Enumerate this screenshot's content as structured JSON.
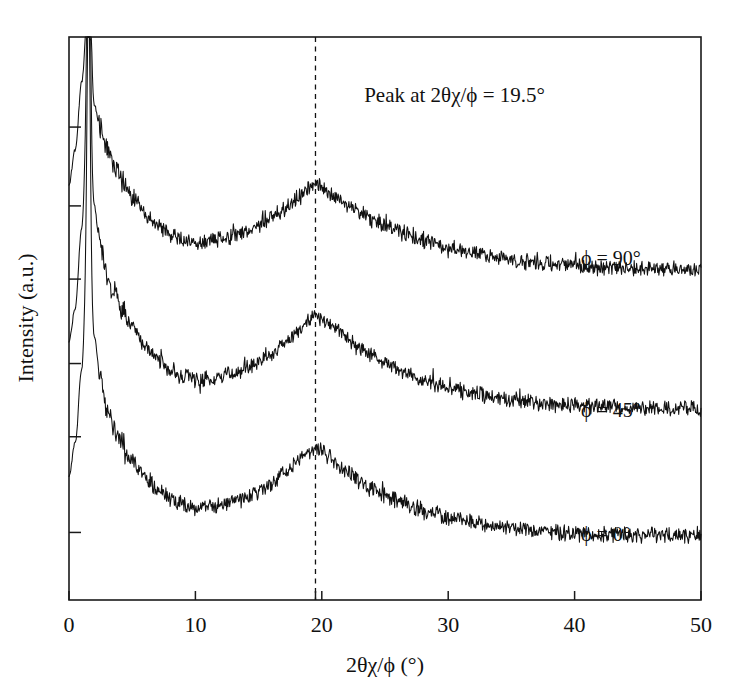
{
  "chart_data": {
    "type": "line",
    "title": "",
    "subtitle": "",
    "xlabel": "2θχ/ϕ (°)",
    "ylabel": "Intensity (a.u.)",
    "xlim": [
      0,
      50
    ],
    "ylim": [
      0,
      1
    ],
    "grid": false,
    "legend_position": "inline-right",
    "xticks": [
      0,
      10,
      20,
      30,
      40,
      50
    ],
    "xticklabels": [
      "0",
      "10",
      "20",
      "30",
      "40",
      "50"
    ],
    "yticks": [
      0.12,
      0.29,
      0.42,
      0.57,
      0.7,
      0.84
    ],
    "yticklabels": [
      "",
      "",
      "",
      "",
      "",
      ""
    ],
    "annotations": [
      {
        "name": "peak-annotation",
        "text": "Peak at 2θχ/ϕ = 19.5°",
        "x": 30.5,
        "y": 0.885
      }
    ],
    "reference_lines": [
      {
        "name": "peak-guideline",
        "orientation": "vertical",
        "x": 19.5,
        "style": "dashed",
        "label": "19.5"
      }
    ],
    "series": [
      {
        "name": "phi-90",
        "label": "ϕ = 90°",
        "label_x": 40.5,
        "label_y": 0.595,
        "offset": 0.565,
        "peak_center": 19.5,
        "peak_height": 0.175,
        "peak_width": 7.2,
        "baseline_decay": 0.055,
        "low_angle_spike_x": 1.55,
        "noise": 0.011,
        "x": [
          0.0,
          0.5,
          1.0,
          1.4,
          1.55,
          1.7,
          2.0,
          2.4,
          3.0,
          3.6,
          4.2,
          5.0,
          6.0,
          7.0,
          8.0,
          9.0,
          10.0,
          11.0,
          12.0,
          13.0,
          14.0,
          15.0,
          16.0,
          17.0,
          18.0,
          19.0,
          19.5,
          20.0,
          21.0,
          22.0,
          23.0,
          24.0,
          25.0,
          26.0,
          28.0,
          30.0,
          32.0,
          34.0,
          36.0,
          38.0,
          40.0,
          42.0,
          44.0,
          46.0,
          48.0,
          50.0
        ],
        "y": [
          0.74,
          0.8,
          0.92,
          1.0,
          1.0,
          0.96,
          0.88,
          0.845,
          0.805,
          0.775,
          0.745,
          0.715,
          0.685,
          0.665,
          0.65,
          0.64,
          0.636,
          0.636,
          0.639,
          0.644,
          0.652,
          0.664,
          0.678,
          0.694,
          0.712,
          0.731,
          0.74,
          0.735,
          0.718,
          0.702,
          0.688,
          0.676,
          0.665,
          0.655,
          0.639,
          0.626,
          0.616,
          0.608,
          0.602,
          0.597,
          0.594,
          0.592,
          0.59,
          0.589,
          0.588,
          0.587
        ]
      },
      {
        "name": "phi-45",
        "label": "ϕ = 45°",
        "label_x": 40.5,
        "label_y": 0.325,
        "offset": 0.285,
        "peak_center": 19.5,
        "peak_height": 0.185,
        "peak_width": 7.0,
        "baseline_decay": 0.055,
        "low_angle_spike_x": 1.55,
        "noise": 0.011,
        "x": [
          0.0,
          0.5,
          1.0,
          1.4,
          1.55,
          1.7,
          2.0,
          2.4,
          3.0,
          3.6,
          4.2,
          5.0,
          6.0,
          7.0,
          8.0,
          9.0,
          10.0,
          11.0,
          12.0,
          13.0,
          14.0,
          15.0,
          16.0,
          17.0,
          18.0,
          19.0,
          19.5,
          20.0,
          21.0,
          22.0,
          23.0,
          24.0,
          25.0,
          26.0,
          28.0,
          30.0,
          32.0,
          34.0,
          36.0,
          38.0,
          40.0,
          42.0,
          44.0,
          46.0,
          48.0,
          50.0
        ],
        "y": [
          0.46,
          0.52,
          0.66,
          0.82,
          0.845,
          0.8,
          0.7,
          0.64,
          0.575,
          0.54,
          0.512,
          0.485,
          0.452,
          0.428,
          0.41,
          0.398,
          0.392,
          0.392,
          0.396,
          0.402,
          0.411,
          0.423,
          0.438,
          0.456,
          0.476,
          0.497,
          0.507,
          0.5,
          0.482,
          0.464,
          0.448,
          0.434,
          0.421,
          0.41,
          0.392,
          0.378,
          0.368,
          0.36,
          0.354,
          0.349,
          0.346,
          0.344,
          0.342,
          0.341,
          0.34,
          0.339
        ]
      },
      {
        "name": "phi-0",
        "label": "ϕ = 0°",
        "label_x": 40.5,
        "label_y": 0.105,
        "offset": 0.04,
        "peak_center": 19.5,
        "peak_height": 0.175,
        "peak_width": 6.8,
        "baseline_decay": 0.055,
        "low_angle_spike_x": 1.55,
        "noise": 0.011,
        "x": [
          0.0,
          0.5,
          1.0,
          1.4,
          1.55,
          1.7,
          2.0,
          2.4,
          3.0,
          3.6,
          4.2,
          5.0,
          6.0,
          7.0,
          8.0,
          9.0,
          10.0,
          11.0,
          12.0,
          13.0,
          14.0,
          15.0,
          16.0,
          17.0,
          18.0,
          19.0,
          19.5,
          20.0,
          21.0,
          22.0,
          23.0,
          24.0,
          25.0,
          26.0,
          28.0,
          30.0,
          32.0,
          34.0,
          36.0,
          38.0,
          40.0,
          42.0,
          44.0,
          46.0,
          48.0,
          50.0
        ],
        "y": [
          0.22,
          0.28,
          0.41,
          0.58,
          0.605,
          0.565,
          0.47,
          0.41,
          0.34,
          0.302,
          0.275,
          0.248,
          0.218,
          0.196,
          0.18,
          0.17,
          0.165,
          0.165,
          0.168,
          0.174,
          0.182,
          0.193,
          0.207,
          0.224,
          0.243,
          0.263,
          0.272,
          0.265,
          0.246,
          0.228,
          0.212,
          0.198,
          0.186,
          0.176,
          0.159,
          0.147,
          0.138,
          0.131,
          0.126,
          0.122,
          0.119,
          0.117,
          0.116,
          0.115,
          0.114,
          0.113
        ]
      }
    ]
  },
  "figure": {
    "plot_area": {
      "left": 69,
      "top": 37,
      "right": 701,
      "bottom": 600
    }
  }
}
